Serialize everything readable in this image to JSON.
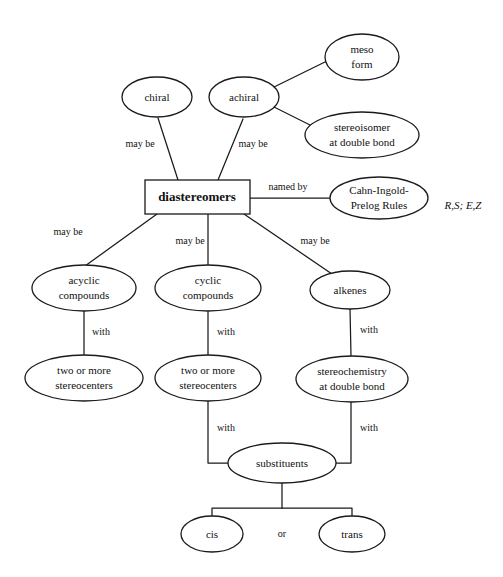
{
  "diagram": {
    "root_label": "diastereomers",
    "side_note": "R,S; E,Z",
    "or_connector": "or",
    "colors": {
      "stroke": "#1a1a1a",
      "text": "#111111",
      "background": "#ffffff"
    },
    "nodes": {
      "chiral": {
        "label": "chiral"
      },
      "achiral": {
        "label": "achiral"
      },
      "meso_form": {
        "line1": "meso",
        "line2": "form"
      },
      "stereoisomer_double_bond": {
        "line1": "stereoisomer",
        "line2": "at double bond"
      },
      "diastereomers": {
        "label": "diastereomers"
      },
      "cahn_ingold_prelog": {
        "line1": "Cahn-Ingold-",
        "line2": "Prelog Rules"
      },
      "acyclic_compounds": {
        "line1": "acyclic",
        "line2": "compounds"
      },
      "cyclic_compounds": {
        "line1": "cyclic",
        "line2": "compounds"
      },
      "alkenes": {
        "label": "alkenes"
      },
      "stereocenters_left": {
        "line1": "two or more",
        "line2": "stereocenters"
      },
      "stereocenters_middle": {
        "line1": "two or more",
        "line2": "stereocenters"
      },
      "stereochemistry_double_bond": {
        "line1": "stereochemistry",
        "line2": "at double bond"
      },
      "substituents": {
        "label": "substituents"
      },
      "cis": {
        "label": "cis"
      },
      "trans": {
        "label": "trans"
      }
    },
    "edge_labels": {
      "chiral_to_root": "may be",
      "achiral_to_root": "may be",
      "root_to_cip": "named by",
      "root_to_acyclic": "may be",
      "root_to_cyclic": "may be",
      "root_to_alkenes": "may be",
      "acyclic_to_stereocenters": "with",
      "cyclic_to_stereocenters": "with",
      "alkenes_to_stereochem": "with",
      "stereocenters_to_substituents": "with",
      "stereochem_to_substituents": "with"
    }
  }
}
